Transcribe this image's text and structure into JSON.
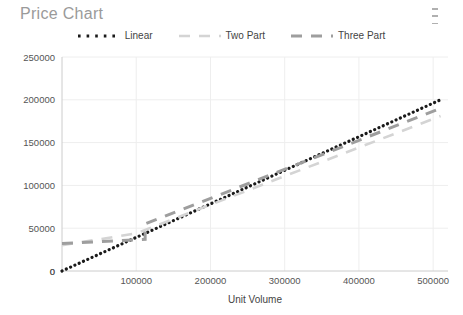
{
  "card": {
    "title": "Price Chart",
    "menu_icon": "kebab-menu-icon"
  },
  "colors": {
    "linear": "#1a1a1a",
    "two_part": "#d4d4d4",
    "three_part": "#9e9e9e",
    "grid": "#eeeeee",
    "axis": "#cccccc",
    "title_text": "#9a9a9a",
    "tick_text": "#555555"
  },
  "chart_data": {
    "type": "line",
    "title": "Price Chart",
    "xlabel": "Unit Volume",
    "ylabel": "",
    "xlim": [
      0,
      520000
    ],
    "ylim": [
      0,
      250000
    ],
    "grid": true,
    "legend_position": "top-center",
    "xticks": [
      0,
      100000,
      200000,
      300000,
      400000,
      500000
    ],
    "xticklabels": [
      "0",
      "100000",
      "200000",
      "300000",
      "400000",
      "500000"
    ],
    "yticks": [
      0,
      50000,
      100000,
      150000,
      200000,
      250000
    ],
    "yticklabels": [
      "0",
      "50000",
      "100000",
      "150000",
      "200000",
      "250000"
    ],
    "series": [
      {
        "name": "Linear",
        "style": "dotted",
        "color": "#1a1a1a",
        "width": 2.4,
        "x": [
          0,
          510000
        ],
        "y": [
          0,
          200000
        ]
      },
      {
        "name": "Two Part",
        "style": "dashed",
        "color": "#d4d4d4",
        "width": 2.6,
        "x": [
          0,
          100000,
          510000
        ],
        "y": [
          30000,
          44000,
          181000
        ]
      },
      {
        "name": "Three Part",
        "style": "dashed",
        "color": "#9e9e9e",
        "width": 3.0,
        "x": [
          0,
          112000,
          112000,
          510000
        ],
        "y": [
          32000,
          37000,
          55000,
          190000
        ]
      }
    ]
  },
  "legend": {
    "items": [
      {
        "label": "Linear",
        "key": "linear"
      },
      {
        "label": "Two Part",
        "key": "two_part"
      },
      {
        "label": "Three Part",
        "key": "three_part"
      }
    ]
  }
}
